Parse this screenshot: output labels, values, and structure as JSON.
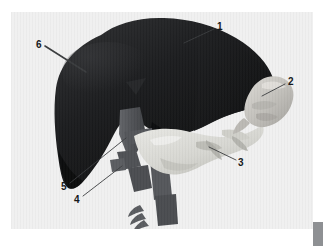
{
  "figure": {
    "kind": "anatomical-3d-render",
    "modality": "grayscale volume rendering",
    "plate_background": "#f0f0f0",
    "page_background": "#ffffff"
  },
  "colors": {
    "liver": "#1b1c1e",
    "liver_shadow": "#0e0f10",
    "liver_highlight": "#39393b",
    "vessel_dark": "#4d4f52",
    "vessel_mid": "#5e6064",
    "organ_light": "#dcdcd8",
    "organ_light_shadow": "#b9b9b4",
    "spleen": "#c9c7c2",
    "leader_line": "#3a3c3e",
    "label_text": "#16181a",
    "page_edge": "#8e9093"
  },
  "labels": [
    {
      "id": "label-1",
      "text": "1",
      "x": 217,
      "y": 22,
      "leader_from": [
        214,
        29
      ],
      "leader_to": [
        184,
        43
      ],
      "points_at": "suprahepatic inferior vena cava stub at liver dome"
    },
    {
      "id": "label-2",
      "text": "2",
      "x": 288,
      "y": 77,
      "leader_from": [
        285,
        84
      ],
      "leader_to": [
        262,
        96
      ],
      "points_at": "rounded light-gray organ at right of frame"
    },
    {
      "id": "label-3",
      "text": "3",
      "x": 238,
      "y": 158,
      "leader_from": [
        236,
        160
      ],
      "leader_to": [
        209,
        147
      ],
      "points_at": "pale lobulated organ below and right of liver"
    },
    {
      "id": "label-4",
      "text": "4",
      "x": 74,
      "y": 195,
      "leader_from": [
        83,
        196
      ],
      "leader_to": [
        122,
        166
      ],
      "points_at": "mid vascular trunk below liver hilum"
    },
    {
      "id": "label-5",
      "text": "5",
      "x": 61,
      "y": 182,
      "leader_from": [
        70,
        183
      ],
      "leader_to": [
        126,
        138
      ],
      "points_at": "vessel at inferior liver margin"
    },
    {
      "id": "label-6",
      "text": "6",
      "x": 36,
      "y": 40,
      "leader_from": [
        45,
        46
      ],
      "leader_to": [
        86,
        72
      ],
      "points_at": "dark liver parenchyma surface"
    }
  ],
  "page_edge": {
    "present": true,
    "position": "bottom-right"
  }
}
